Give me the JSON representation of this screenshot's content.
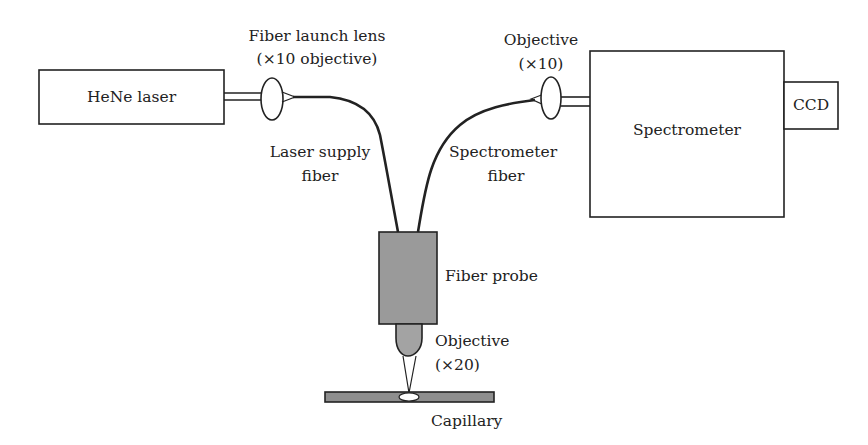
{
  "diagram": {
    "type": "optical-setup-schematic",
    "components": {
      "laser": {
        "label": "HeNe laser"
      },
      "launch_lens": {
        "label_line1": "Fiber launch lens",
        "label_line2": "(×10 objective)"
      },
      "laser_fiber": {
        "label_line1": "Laser supply",
        "label_line2": "fiber"
      },
      "spectrometer_objective": {
        "label_line1": "Objective",
        "label_line2": "(×10)"
      },
      "spectrometer_fiber": {
        "label_line1": "Spectrometer",
        "label_line2": "fiber"
      },
      "spectrometer": {
        "label": "Spectrometer"
      },
      "ccd": {
        "label": "CCD"
      },
      "probe": {
        "label": "Fiber probe"
      },
      "probe_objective": {
        "label_line1": "Objective",
        "label_line2": "(×20)"
      },
      "capillary": {
        "label": "Capillary"
      }
    },
    "colors": {
      "line": "#222222",
      "probe_fill": "#9a9a9a",
      "capillary_fill": "#8e8e8e",
      "background": "#ffffff"
    }
  }
}
